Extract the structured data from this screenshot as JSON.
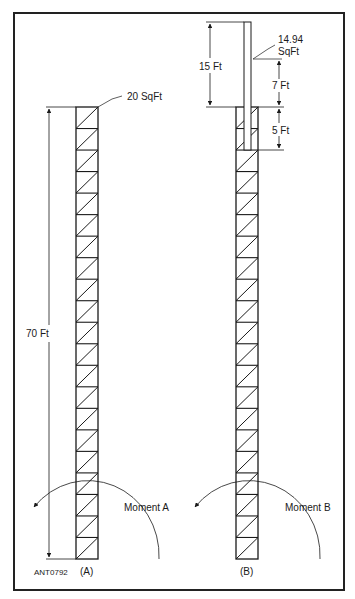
{
  "figure_id": "ANT0792",
  "towers": [
    {
      "id": "A",
      "caption": "(A)",
      "height_label": "70 Ft",
      "area_label": "20 SqFt",
      "moment_label": "Moment A",
      "segments": 21
    },
    {
      "id": "B",
      "caption": "(B)",
      "mast_height_label": "15 Ft",
      "mast_area_label_line1": "14.94",
      "mast_area_label_line2": "SqFt",
      "upper_dim_label": "7 Ft",
      "lower_dim_label": "5 Ft",
      "moment_label": "Moment B",
      "segments": 21
    }
  ],
  "colors": {
    "line": "#1a1a1a",
    "frame": "#222222",
    "background": "#ffffff"
  }
}
